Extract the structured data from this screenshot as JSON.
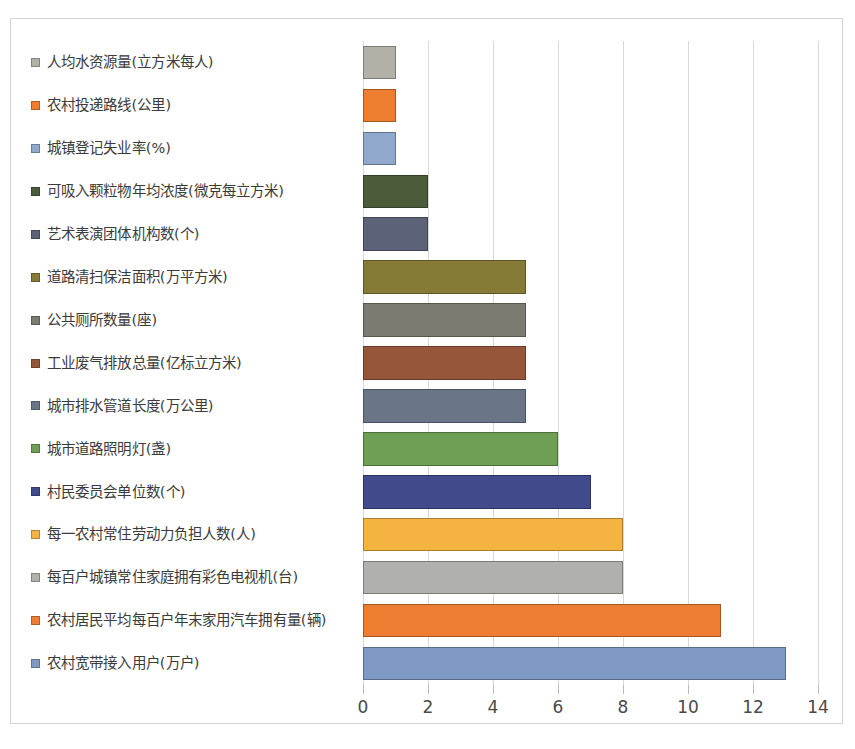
{
  "chart_data": {
    "type": "bar",
    "orientation": "horizontal",
    "title": "",
    "xlabel": "",
    "ylabel": "",
    "xlim": [
      0,
      14
    ],
    "xticks": [
      "0",
      "2",
      "4",
      "6",
      "8",
      "10",
      "12",
      "14"
    ],
    "grid": true,
    "legend_position": "left",
    "categories": [
      "人均水资源量(立方米每人)",
      "农村投递路线(公里)",
      "城镇登记失业率(%)",
      "可吸入颗粒物年均浓度(微克每立方米)",
      "艺术表演团体机构数(个)",
      "道路清扫保洁面积(万平方米)",
      "公共厕所数量(座)",
      "工业废气排放总量(亿标立方米)",
      "城市排水管道长度(万公里)",
      "城市道路照明灯(盏)",
      "村民委员会单位数(个)",
      "每一农村常住劳动力负担人数(人)",
      "每百户城镇常住家庭拥有彩色电视机(台)",
      "农村居民平均每百户年末家用汽车拥有量(辆)",
      "农村宽带接入用户(万户)"
    ],
    "values": [
      1,
      1,
      1,
      2,
      2,
      5,
      5,
      5,
      5,
      6,
      7,
      8,
      8,
      11,
      13
    ],
    "colors": [
      "#b3b0a8",
      "#ed7d31",
      "#8fa8cc",
      "#4a5c3a",
      "#5c6378",
      "#857b36",
      "#7b7b72",
      "#95563a",
      "#6b7588",
      "#6f9e55",
      "#404a8c",
      "#f5b342",
      "#b0b0ac",
      "#ed7d31",
      "#7e9ac4"
    ]
  },
  "axis": {
    "tick_color": "#b8b8b8",
    "grid_color": "#d9d9d9",
    "label_color": "#4a4a4a"
  },
  "frame": {
    "border_color": "#d4d4d4",
    "background": "#ffffff"
  }
}
